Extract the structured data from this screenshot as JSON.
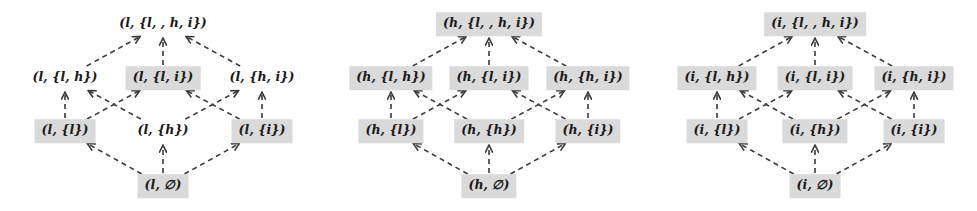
{
  "figure": {
    "type": "hasse-diagram-triptych",
    "background_color": "#ffffff",
    "node_shaded_color": "#dadada",
    "edge_color": "#3a3a3a",
    "edge_style": "dashed-arrow-upward",
    "text_color": "#1a1a1a"
  },
  "diagrams": [
    {
      "id": "lattice-l",
      "level": "l",
      "nodes": [
        {
          "id": "l-top",
          "label": "(l, {l, , h, i})",
          "row": 0,
          "col": 1,
          "shaded": false
        },
        {
          "id": "l-lh",
          "label": "(l, {l, h})",
          "row": 1,
          "col": 0,
          "shaded": false
        },
        {
          "id": "l-li",
          "label": "(l, {l, i})",
          "row": 1,
          "col": 1,
          "shaded": true
        },
        {
          "id": "l-hi",
          "label": "(l, {h, i})",
          "row": 1,
          "col": 2,
          "shaded": false
        },
        {
          "id": "l-l",
          "label": "(l, {l})",
          "row": 2,
          "col": 0,
          "shaded": true
        },
        {
          "id": "l-h",
          "label": "(l, {h})",
          "row": 2,
          "col": 1,
          "shaded": false
        },
        {
          "id": "l-i",
          "label": "(l, {i})",
          "row": 2,
          "col": 2,
          "shaded": true
        },
        {
          "id": "l-bot",
          "label": "(l, ∅)",
          "row": 3,
          "col": 1,
          "shaded": true
        }
      ],
      "edges": [
        {
          "from": "l-bot",
          "to": "l-l"
        },
        {
          "from": "l-bot",
          "to": "l-h"
        },
        {
          "from": "l-bot",
          "to": "l-i"
        },
        {
          "from": "l-l",
          "to": "l-lh"
        },
        {
          "from": "l-l",
          "to": "l-li"
        },
        {
          "from": "l-h",
          "to": "l-lh"
        },
        {
          "from": "l-h",
          "to": "l-hi"
        },
        {
          "from": "l-i",
          "to": "l-li"
        },
        {
          "from": "l-i",
          "to": "l-hi"
        },
        {
          "from": "l-lh",
          "to": "l-top"
        },
        {
          "from": "l-li",
          "to": "l-top"
        },
        {
          "from": "l-hi",
          "to": "l-top"
        }
      ]
    },
    {
      "id": "lattice-h",
      "level": "h",
      "nodes": [
        {
          "id": "h-top",
          "label": "(h, {l, , h, i})",
          "row": 0,
          "col": 1,
          "shaded": true
        },
        {
          "id": "h-lh",
          "label": "(h, {l, h})",
          "row": 1,
          "col": 0,
          "shaded": true
        },
        {
          "id": "h-li",
          "label": "(h, {l, i})",
          "row": 1,
          "col": 1,
          "shaded": true
        },
        {
          "id": "h-hi",
          "label": "(h, {h, i})",
          "row": 1,
          "col": 2,
          "shaded": true
        },
        {
          "id": "h-l",
          "label": "(h, {l})",
          "row": 2,
          "col": 0,
          "shaded": true
        },
        {
          "id": "h-h",
          "label": "(h, {h})",
          "row": 2,
          "col": 1,
          "shaded": true
        },
        {
          "id": "h-i",
          "label": "(h, {i})",
          "row": 2,
          "col": 2,
          "shaded": true
        },
        {
          "id": "h-bot",
          "label": "(h, ∅)",
          "row": 3,
          "col": 1,
          "shaded": true
        }
      ],
      "edges": [
        {
          "from": "h-bot",
          "to": "h-l"
        },
        {
          "from": "h-bot",
          "to": "h-h"
        },
        {
          "from": "h-bot",
          "to": "h-i"
        },
        {
          "from": "h-l",
          "to": "h-lh"
        },
        {
          "from": "h-l",
          "to": "h-li"
        },
        {
          "from": "h-h",
          "to": "h-lh"
        },
        {
          "from": "h-h",
          "to": "h-hi"
        },
        {
          "from": "h-i",
          "to": "h-li"
        },
        {
          "from": "h-i",
          "to": "h-hi"
        },
        {
          "from": "h-lh",
          "to": "h-top"
        },
        {
          "from": "h-li",
          "to": "h-top"
        },
        {
          "from": "h-hi",
          "to": "h-top"
        }
      ]
    },
    {
      "id": "lattice-i",
      "level": "i",
      "nodes": [
        {
          "id": "i-top",
          "label": "(i, {l, , h, i})",
          "row": 0,
          "col": 1,
          "shaded": true
        },
        {
          "id": "i-lh",
          "label": "(i, {l, h})",
          "row": 1,
          "col": 0,
          "shaded": true
        },
        {
          "id": "i-li",
          "label": "(i, {l, i})",
          "row": 1,
          "col": 1,
          "shaded": true
        },
        {
          "id": "i-hi",
          "label": "(i, {h, i})",
          "row": 1,
          "col": 2,
          "shaded": true
        },
        {
          "id": "i-l",
          "label": "(i, {l})",
          "row": 2,
          "col": 0,
          "shaded": true
        },
        {
          "id": "i-h",
          "label": "(i, {h})",
          "row": 2,
          "col": 1,
          "shaded": true
        },
        {
          "id": "i-i",
          "label": "(i, {i})",
          "row": 2,
          "col": 2,
          "shaded": true
        },
        {
          "id": "i-bot",
          "label": "(i, ∅)",
          "row": 3,
          "col": 1,
          "shaded": true
        }
      ],
      "edges": [
        {
          "from": "i-bot",
          "to": "i-l"
        },
        {
          "from": "i-bot",
          "to": "i-h"
        },
        {
          "from": "i-bot",
          "to": "i-i"
        },
        {
          "from": "i-l",
          "to": "i-lh"
        },
        {
          "from": "i-l",
          "to": "i-li"
        },
        {
          "from": "i-h",
          "to": "i-lh"
        },
        {
          "from": "i-h",
          "to": "i-hi"
        },
        {
          "from": "i-i",
          "to": "i-li"
        },
        {
          "from": "i-i",
          "to": "i-hi"
        },
        {
          "from": "i-lh",
          "to": "i-top"
        },
        {
          "from": "i-li",
          "to": "i-top"
        },
        {
          "from": "i-hi",
          "to": "i-top"
        }
      ]
    }
  ],
  "layout": {
    "panel_width": 326,
    "panel_origins": [
      0,
      326,
      652
    ],
    "row_y": [
      24,
      78,
      131,
      186
    ],
    "col_x": [
      65,
      163,
      262
    ]
  }
}
